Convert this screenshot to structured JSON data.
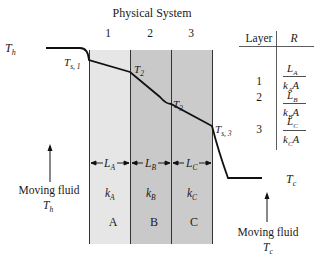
{
  "title": "Physical System",
  "layer_numbers": [
    "1",
    "2",
    "3"
  ],
  "layers": [
    {
      "id": "A",
      "thickness": "L",
      "thickness_sub": "A",
      "conductivity": "k",
      "conductivity_sub": "A",
      "fill": "#e6e6e6"
    },
    {
      "id": "B",
      "thickness": "L",
      "thickness_sub": "B",
      "conductivity": "k",
      "conductivity_sub": "B",
      "fill": "#c9c9c9"
    },
    {
      "id": "C",
      "thickness": "L",
      "thickness_sub": "C",
      "conductivity": "k",
      "conductivity_sub": "C",
      "fill": "#cbcbcb"
    }
  ],
  "temperatures": {
    "hot": {
      "symbol": "T",
      "sub": "h"
    },
    "surface1": {
      "symbol": "T",
      "sub": "s, 1"
    },
    "interface2": {
      "symbol": "T",
      "sub": "2"
    },
    "interface3": {
      "symbol": "T",
      "sub": "3"
    },
    "surface3": {
      "symbol": "T",
      "sub": "s, 3"
    },
    "cold": {
      "symbol": "T",
      "sub": "c"
    }
  },
  "fluids": {
    "left": {
      "label": "Moving fluid",
      "temp_symbol": "T",
      "temp_sub": "h"
    },
    "right": {
      "label": "Moving fluid",
      "temp_symbol": "T",
      "temp_sub": "c"
    }
  },
  "resistance_table": {
    "headers": [
      "Layer",
      "R"
    ],
    "rows": [
      {
        "layer": "1",
        "num": "L",
        "num_sub": "A",
        "den": "k",
        "den_sub": "A",
        "den_tail": "A"
      },
      {
        "layer": "2",
        "num": "L",
        "num_sub": "B",
        "den": "k",
        "den_sub": "B",
        "den_tail": "A"
      },
      {
        "layer": "3",
        "num": "L",
        "num_sub": "C",
        "den": "k",
        "den_sub": "C",
        "den_tail": "A"
      }
    ]
  }
}
